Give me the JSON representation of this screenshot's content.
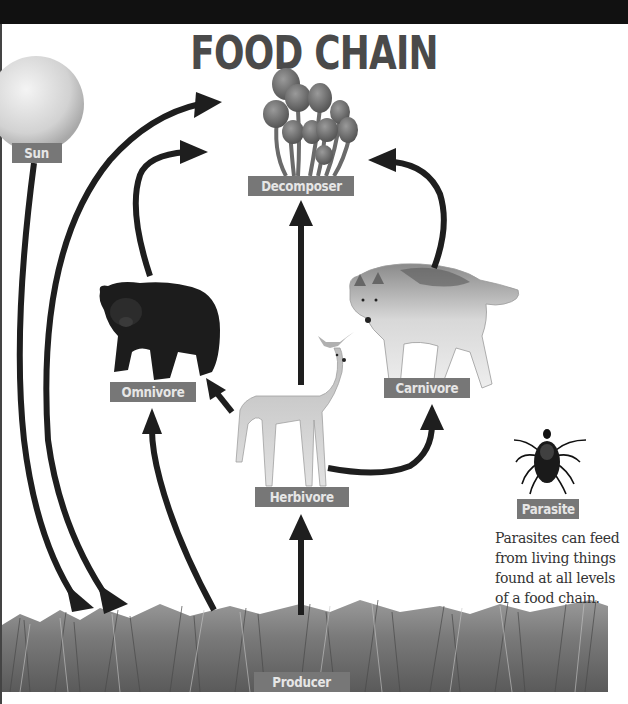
{
  "title": "FOOD CHAIN",
  "labels": {
    "sun": "Sun",
    "decomposer": "Decomposer",
    "omnivore": "Omnivore",
    "carnivore": "Carnivore",
    "herbivore": "Herbivore",
    "parasite": "Parasite",
    "producer": "Producer"
  },
  "organisms": {
    "sun": "sun-sphere",
    "decomposer": "mushroom-cluster",
    "omnivore": "bear",
    "carnivore": "wolf",
    "herbivore": "deer",
    "parasite": "tick",
    "producer": "grass"
  },
  "parasite_note": "Parasites can feed from living things found at all levels of a food chain.",
  "arrows": [
    {
      "from": "Sun",
      "to": "Producer"
    },
    {
      "from": "Producer",
      "to": "Herbivore"
    },
    {
      "from": "Producer",
      "to": "Omnivore"
    },
    {
      "from": "Herbivore",
      "to": "Omnivore"
    },
    {
      "from": "Herbivore",
      "to": "Carnivore"
    },
    {
      "from": "Herbivore",
      "to": "Decomposer"
    },
    {
      "from": "Omnivore",
      "to": "Decomposer"
    },
    {
      "from": "Carnivore",
      "to": "Decomposer"
    },
    {
      "from": "Producer",
      "to": "Decomposer"
    }
  ],
  "colors": {
    "label_bg": "#777777",
    "label_text": "#e6e6e6",
    "arrow": "#1e1e1e",
    "title": "#4a4a4a"
  }
}
